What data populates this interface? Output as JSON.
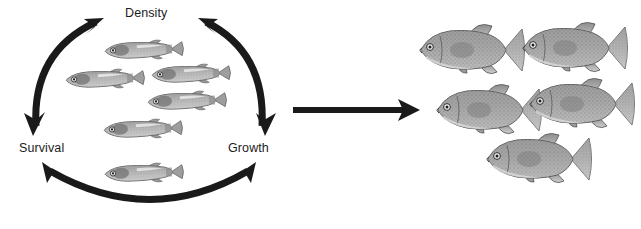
{
  "figure": {
    "width": 641,
    "height": 229,
    "background": "#ffffff",
    "ink_color": "#1a1a1a",
    "text_color": "#1c1c1c"
  },
  "cycle": {
    "name": "density-growth-survival-cycle",
    "nodes": [
      {
        "id": "density",
        "label": "Density",
        "x": 155,
        "y": 13
      },
      {
        "id": "survival",
        "label": "Survival",
        "x": 45,
        "y": 148
      },
      {
        "id": "growth",
        "label": "Growth",
        "x": 252,
        "y": 148
      }
    ],
    "arcs": [
      {
        "id": "survival-density",
        "from": "survival",
        "to": "density",
        "double_headed": true
      },
      {
        "id": "density-growth",
        "from": "density",
        "to": "growth",
        "double_headed": true
      },
      {
        "id": "survival-growth",
        "from": "survival",
        "to": "growth",
        "double_headed": true
      }
    ],
    "juvenile_fish": [
      {
        "cx": 143,
        "cy": 50,
        "len": 74,
        "h": 15,
        "tilt": -2
      },
      {
        "cx": 104,
        "cy": 79,
        "len": 74,
        "h": 15,
        "tilt": -2
      },
      {
        "cx": 190,
        "cy": 74,
        "len": 74,
        "h": 15,
        "tilt": -2
      },
      {
        "cx": 186,
        "cy": 101,
        "len": 74,
        "h": 15,
        "tilt": -2
      },
      {
        "cx": 142,
        "cy": 129,
        "len": 74,
        "h": 15,
        "tilt": -2
      },
      {
        "cx": 143,
        "cy": 173,
        "len": 74,
        "h": 15,
        "tilt": -2
      }
    ]
  },
  "transition": {
    "name": "growth-transition-arrow",
    "direction": "right",
    "x1": 293,
    "x2": 420,
    "y": 110
  },
  "adults": {
    "name": "adult-fish-group",
    "fish": [
      {
        "cx": 470,
        "cy": 50,
        "len": 100,
        "h": 44
      },
      {
        "cx": 573,
        "cy": 48,
        "len": 100,
        "h": 44
      },
      {
        "cx": 487,
        "cy": 110,
        "len": 100,
        "h": 44
      },
      {
        "cx": 580,
        "cy": 104,
        "len": 100,
        "h": 44
      },
      {
        "cx": 537,
        "cy": 159,
        "len": 100,
        "h": 44
      }
    ]
  }
}
